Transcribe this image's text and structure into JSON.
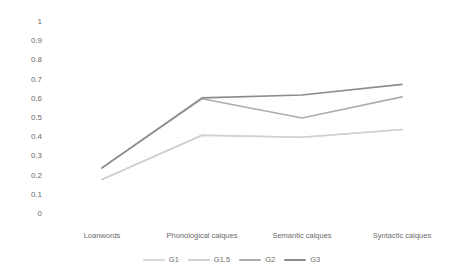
{
  "chart_data": {
    "type": "line",
    "title": "",
    "xlabel": "",
    "ylabel": "",
    "categories": [
      "Loanwords",
      "Phonological calques",
      "Semantic calques",
      "Syntactic calques"
    ],
    "ylim": [
      0,
      1
    ],
    "yticks": [
      "0",
      "0.1",
      "0.2",
      "0.3",
      "0.4",
      "0.5",
      "0.6",
      "0.7",
      "0.8",
      "0.9",
      "1"
    ],
    "grid": true,
    "legend_position": "bottom",
    "series": [
      {
        "name": "G1",
        "values": [
          0.18,
          0.41,
          0.4,
          0.44
        ],
        "color": "#d9d9d9"
      },
      {
        "name": "G1.5",
        "values": [
          0.18,
          0.41,
          0.4,
          0.44
        ],
        "color": "#d0d0d0"
      },
      {
        "name": "G2",
        "values": [
          0.24,
          0.6,
          0.5,
          0.61
        ],
        "color": "#adadad"
      },
      {
        "name": "G3",
        "values": [
          0.24,
          0.605,
          0.62,
          0.675
        ],
        "color": "#8c8c8c"
      }
    ]
  },
  "axis": {
    "y_labels": [
      "1",
      "0.9",
      "0.8",
      "0.7",
      "0.6",
      "0.5",
      "0.4",
      "0.3",
      "0.2",
      "0.1",
      "0"
    ],
    "x_labels": [
      "Loanwords",
      "Phonological calques",
      "Semantic calques",
      "Syntactic calques"
    ]
  },
  "legend": {
    "items": [
      {
        "label": "G1"
      },
      {
        "label": "G1.5"
      },
      {
        "label": "G2"
      },
      {
        "label": "G3"
      }
    ]
  },
  "colors": {
    "text": "#6b6b6b",
    "grid": "#fbfbfb",
    "background": "#ffffff"
  }
}
